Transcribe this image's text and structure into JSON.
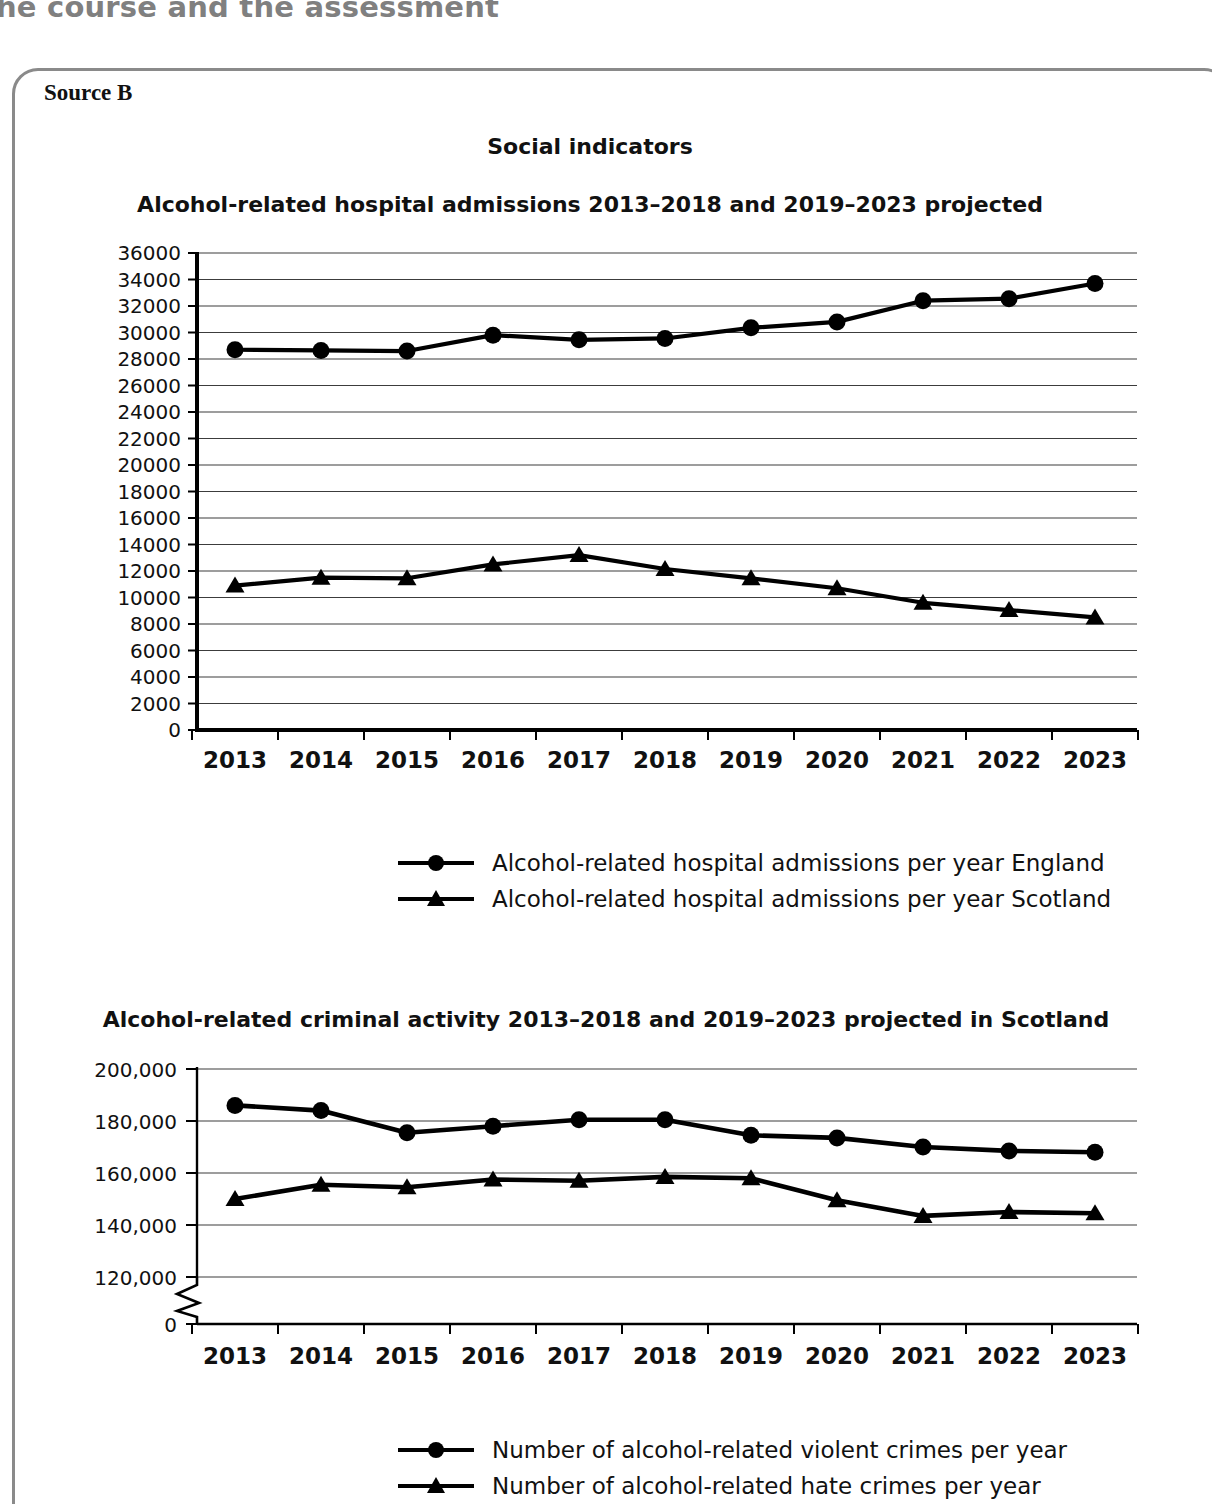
{
  "page": {
    "header_text": "he course and the assessment",
    "source_label": "Source B",
    "section_title": "Social indicators"
  },
  "chart_data": [
    {
      "id": "hospital-admissions",
      "type": "line",
      "title": "Alcohol-related hospital admissions 2013–2018 and 2019–2023 projected",
      "xlabel": "",
      "ylabel": "",
      "x": [
        "2013",
        "2014",
        "2015",
        "2016",
        "2017",
        "2018",
        "2019",
        "2020",
        "2021",
        "2022",
        "2023"
      ],
      "ylim": [
        0,
        36000
      ],
      "ytick_step": 2000,
      "yticks": [
        "36000",
        "34000",
        "32000",
        "30000",
        "28000",
        "26000",
        "24000",
        "22000",
        "20000",
        "18000",
        "16000",
        "14000",
        "12000",
        "10000",
        "8000",
        "6000",
        "4000",
        "2000",
        "0"
      ],
      "grid": true,
      "legend_position": "bottom",
      "series": [
        {
          "name": "Alcohol-related hospital admissions per year England",
          "marker": "circle",
          "values": [
            28700,
            28650,
            28600,
            29800,
            29450,
            29550,
            30350,
            30800,
            32400,
            32550,
            33700
          ]
        },
        {
          "name": "Alcohol-related hospital admissions per year Scotland",
          "marker": "triangle",
          "values": [
            10900,
            11500,
            11450,
            12500,
            13200,
            12150,
            11450,
            10700,
            9600,
            9050,
            8500
          ]
        }
      ]
    },
    {
      "id": "criminal-activity",
      "type": "line",
      "title": "Alcohol-related criminal activity 2013–2018 and 2019–2023 projected in Scotland",
      "xlabel": "",
      "ylabel": "",
      "x": [
        "2013",
        "2014",
        "2015",
        "2016",
        "2017",
        "2018",
        "2019",
        "2020",
        "2021",
        "2022",
        "2023"
      ],
      "ylim": [
        120000,
        200000
      ],
      "ytick_step": 20000,
      "yticks": [
        "200,000",
        "180,000",
        "160,000",
        "140,000",
        "120,000",
        "0"
      ],
      "axis_break": true,
      "grid": true,
      "legend_position": "bottom",
      "series": [
        {
          "name": "Number of alcohol-related violent crimes per year",
          "marker": "circle",
          "values": [
            186000,
            184000,
            175500,
            178000,
            180500,
            180500,
            174500,
            173500,
            170000,
            168500,
            168000
          ]
        },
        {
          "name": "Number of alcohol-related hate crimes per year",
          "marker": "triangle",
          "values": [
            150000,
            155500,
            154500,
            157500,
            157000,
            158500,
            158000,
            149500,
            143500,
            145000,
            144500
          ]
        }
      ]
    }
  ]
}
